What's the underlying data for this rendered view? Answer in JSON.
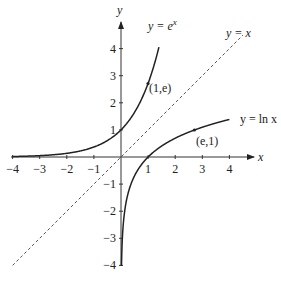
{
  "chart_data": {
    "type": "line",
    "title": "",
    "xlabel": "x",
    "ylabel": "y",
    "xlim": [
      -4,
      4
    ],
    "ylim": [
      -4,
      4
    ],
    "grid": false,
    "x_ticks": [
      "-4",
      "-3",
      "-2",
      "-1",
      "1",
      "2",
      "3",
      "4"
    ],
    "y_ticks": [
      "4",
      "3",
      "2",
      "1",
      "-1",
      "-2",
      "-3",
      "-4"
    ],
    "series": [
      {
        "name": "y = e^x",
        "function": "exp(x)",
        "style": "solid",
        "x_range": [
          -4,
          1.4
        ]
      },
      {
        "name": "y = x",
        "function": "x",
        "style": "dashed",
        "x_range": [
          -4,
          4.5
        ]
      },
      {
        "name": "y = ln x",
        "function": "ln(x)",
        "style": "solid",
        "x_range": [
          0.018,
          4
        ]
      }
    ],
    "annotations": [
      {
        "text": "(1,e)",
        "x": 1,
        "y": 2.718
      },
      {
        "text": "(e,1)",
        "x": 2.718,
        "y": 1
      }
    ],
    "legend_labels": {
      "exp": {
        "pre": "y = e",
        "sup": "x"
      },
      "identity": "y = x",
      "ln": "y = ln x"
    }
  }
}
